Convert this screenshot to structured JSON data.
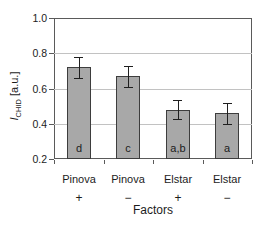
{
  "colors": {
    "bar_fill": "#a8a8a8",
    "bar_border": "#3d3d3d",
    "gridline": "#c2c2c2",
    "axis": "#5a5a5a",
    "error_bar": "#1f1f1f",
    "text": "#1c1c1c",
    "background": "#ffffff"
  },
  "chart_data": {
    "type": "bar",
    "title": "",
    "xlabel": "Factors",
    "ylabel": "I_CHID [a.u.]",
    "ylabel_parts": {
      "symbol": "I",
      "subscript": "CHID",
      "units": " [a.u.]"
    },
    "categories": [
      "Pinova",
      "Pinova",
      "Elstar",
      "Elstar"
    ],
    "factor_signs": [
      "+",
      "−",
      "+",
      "−"
    ],
    "values": [
      0.72,
      0.67,
      0.48,
      0.46
    ],
    "errors": [
      0.06,
      0.06,
      0.055,
      0.06
    ],
    "significance_letters": [
      "d",
      "c",
      "a,b",
      "a"
    ],
    "ylim": [
      0.2,
      1.0
    ],
    "yticks": [
      "1.0",
      "0.8",
      "0.6",
      "0.4",
      "0.2"
    ],
    "grid": true,
    "legend": null
  }
}
